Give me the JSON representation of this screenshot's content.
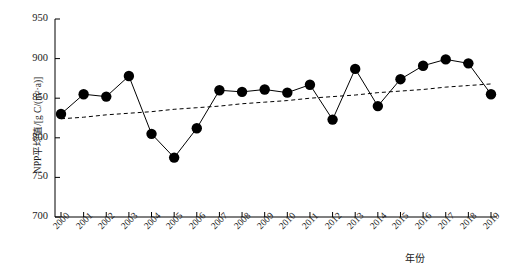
{
  "chart_data": {
    "type": "line",
    "title": "",
    "xlabel": "年份",
    "ylabel": "NPP平均值/[g C/(m²·a)]",
    "categories": [
      "2000",
      "2001",
      "2002",
      "2003",
      "2004",
      "2005",
      "2006",
      "2007",
      "2008",
      "2009",
      "2010",
      "2011",
      "2012",
      "2013",
      "2014",
      "2015",
      "2016",
      "2017",
      "2018",
      "2019"
    ],
    "series": [
      {
        "name": "NPP平均值",
        "style": "line-with-markers",
        "marker": "filled-circle",
        "color": "#000000",
        "values": [
          830,
          855,
          852,
          878,
          805,
          775,
          812,
          860,
          858,
          861,
          857,
          867,
          823,
          887,
          840,
          874,
          891,
          899,
          894,
          855
        ]
      },
      {
        "name": "趋势线",
        "style": "dashed-trendline",
        "color": "#000000",
        "values": [
          824,
          826,
          829,
          831,
          833,
          836,
          838,
          840,
          843,
          845,
          847,
          850,
          852,
          854,
          857,
          859,
          861,
          864,
          866,
          868
        ]
      }
    ],
    "ylim": [
      700,
      950
    ],
    "yticks": [
      700,
      750,
      800,
      850,
      900,
      950
    ],
    "ytick_labels": [
      "700",
      "750",
      "800",
      "850",
      "900",
      "950"
    ],
    "grid": false,
    "legend": "none",
    "axis_color": "#000000"
  }
}
